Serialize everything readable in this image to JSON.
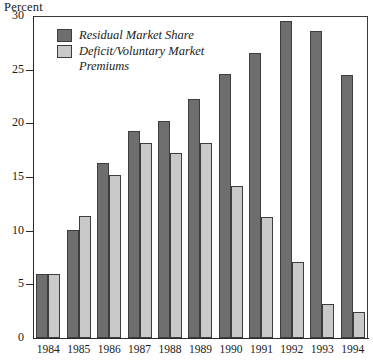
{
  "chart_data": {
    "type": "bar",
    "title": "",
    "xlabel": "",
    "ylabel": "Percent",
    "ylim": [
      0,
      30
    ],
    "yticks": [
      0,
      5,
      10,
      15,
      20,
      25,
      30
    ],
    "grid": false,
    "legend_position": "upper-left-inside",
    "categories": [
      "1984",
      "1985",
      "1986",
      "1987",
      "1988",
      "1989",
      "1990",
      "1991",
      "1992",
      "1993",
      "1994"
    ],
    "series": [
      {
        "name": "Residual Market Share",
        "color": "#6e6e6e",
        "values": [
          6.0,
          10.1,
          16.3,
          19.3,
          20.2,
          22.3,
          24.6,
          26.6,
          29.5,
          28.6,
          24.5
        ]
      },
      {
        "name": "Deficit/Voluntary Market Premiums",
        "color": "#c9c9c9",
        "values": [
          6.0,
          11.4,
          15.2,
          18.2,
          17.2,
          18.2,
          14.2,
          11.3,
          7.1,
          3.2,
          2.4
        ]
      }
    ]
  },
  "axis": {
    "y_title": "Percent",
    "y_tick_labels": [
      "0",
      "5",
      "10",
      "15",
      "20",
      "25",
      "30"
    ]
  },
  "legend": {
    "items": [
      {
        "label": "Residual Market Share",
        "swatch": "dark"
      },
      {
        "label": "Deficit/Voluntary Market\nPremiums",
        "swatch": "light"
      }
    ]
  }
}
